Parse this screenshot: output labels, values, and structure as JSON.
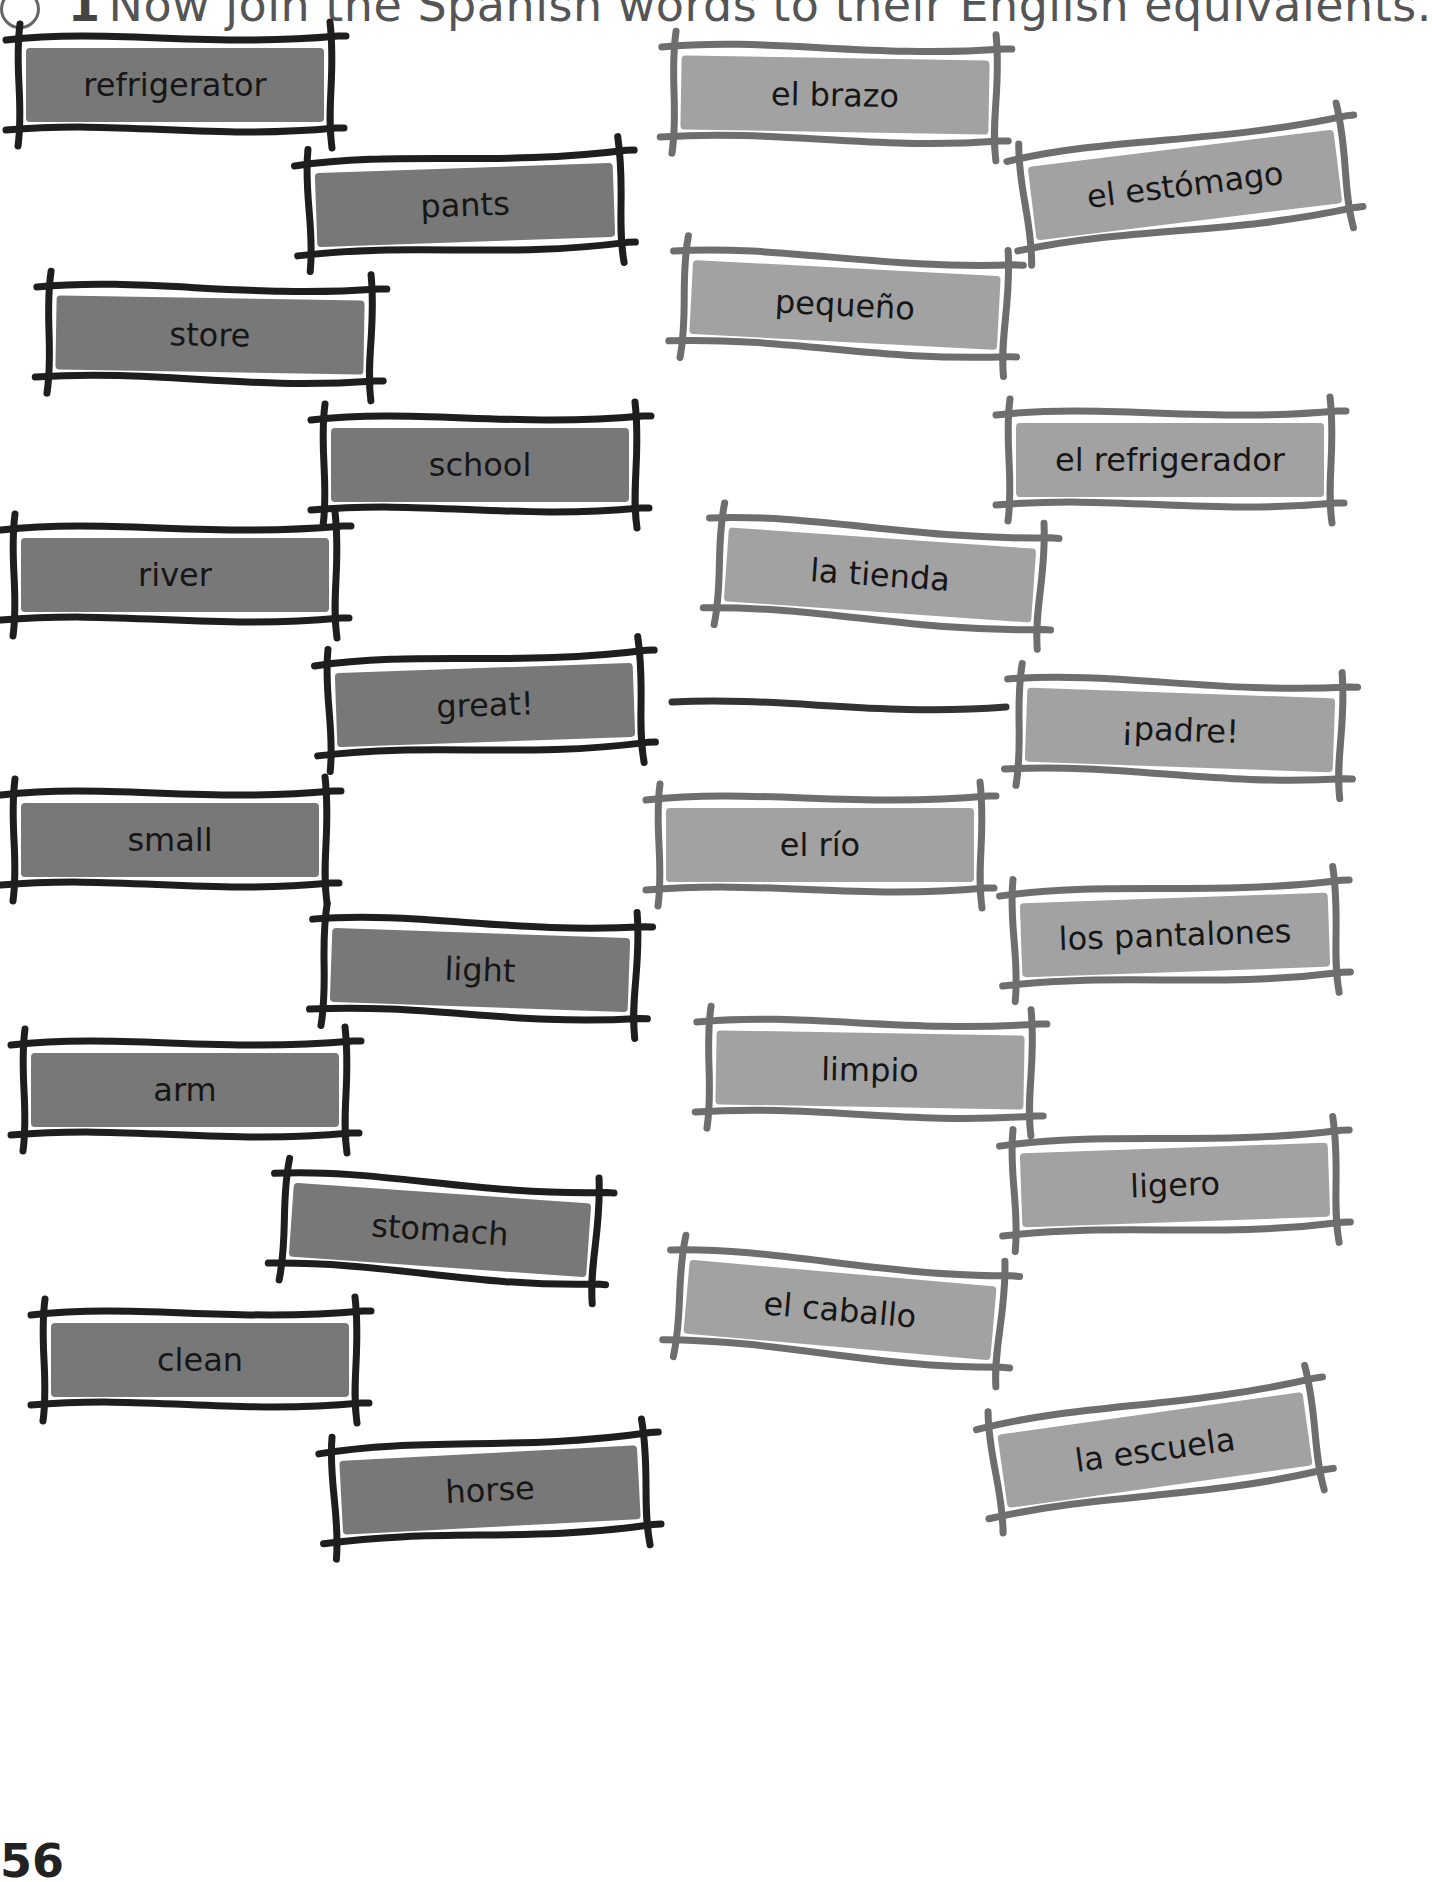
{
  "instruction": {
    "number_badge": "1",
    "text": "Now join the Spanish words to their English equivalents."
  },
  "colors": {
    "english_card_fill": "#787878",
    "english_card_frame": "#1e1e1e",
    "spanish_card_fill": "#a2a2a2",
    "spanish_card_frame": "#6e6e6e",
    "connector": "#333333"
  },
  "english_words": [
    {
      "label": "refrigerator",
      "x": 10,
      "y": 30,
      "w": 330,
      "h": 110,
      "rot": 0
    },
    {
      "label": "pants",
      "x": 300,
      "y": 150,
      "w": 330,
      "h": 110,
      "rot": -2
    },
    {
      "label": "store",
      "x": 40,
      "y": 280,
      "w": 340,
      "h": 110,
      "rot": 1
    },
    {
      "label": "school",
      "x": 315,
      "y": 410,
      "w": 330,
      "h": 110,
      "rot": 0
    },
    {
      "label": "river",
      "x": 5,
      "y": 520,
      "w": 340,
      "h": 110,
      "rot": 0
    },
    {
      "label": "great!",
      "x": 320,
      "y": 650,
      "w": 330,
      "h": 110,
      "rot": -2
    },
    {
      "label": "small",
      "x": 5,
      "y": 785,
      "w": 330,
      "h": 110,
      "rot": 0
    },
    {
      "label": "light",
      "x": 315,
      "y": 915,
      "w": 330,
      "h": 110,
      "rot": 2
    },
    {
      "label": "arm",
      "x": 15,
      "y": 1035,
      "w": 340,
      "h": 110,
      "rot": 0
    },
    {
      "label": "stomach",
      "x": 275,
      "y": 1175,
      "w": 330,
      "h": 110,
      "rot": 4
    },
    {
      "label": "clean",
      "x": 35,
      "y": 1305,
      "w": 330,
      "h": 110,
      "rot": 0
    },
    {
      "label": "horse",
      "x": 325,
      "y": 1435,
      "w": 330,
      "h": 110,
      "rot": -3
    }
  ],
  "spanish_words": [
    {
      "label": "el brazo",
      "x": 665,
      "y": 40,
      "w": 340,
      "h": 110,
      "rot": 1
    },
    {
      "label": "el estómago",
      "x": 1015,
      "y": 130,
      "w": 340,
      "h": 110,
      "rot": -7
    },
    {
      "label": "pequeño",
      "x": 675,
      "y": 250,
      "w": 340,
      "h": 110,
      "rot": 3
    },
    {
      "label": "el refrigerador",
      "x": 1000,
      "y": 405,
      "w": 340,
      "h": 110,
      "rot": 0
    },
    {
      "label": "la tienda",
      "x": 710,
      "y": 520,
      "w": 340,
      "h": 110,
      "rot": 4
    },
    {
      "label": "¡padre!",
      "x": 1010,
      "y": 675,
      "w": 340,
      "h": 110,
      "rot": 2
    },
    {
      "label": "el río",
      "x": 650,
      "y": 790,
      "w": 340,
      "h": 110,
      "rot": 0
    },
    {
      "label": "los pantalones",
      "x": 1005,
      "y": 880,
      "w": 340,
      "h": 110,
      "rot": -2
    },
    {
      "label": "limpio",
      "x": 700,
      "y": 1015,
      "w": 340,
      "h": 110,
      "rot": 1
    },
    {
      "label": "ligero",
      "x": 1005,
      "y": 1130,
      "w": 340,
      "h": 110,
      "rot": -2
    },
    {
      "label": "el caballo",
      "x": 670,
      "y": 1255,
      "w": 340,
      "h": 110,
      "rot": 5
    },
    {
      "label": "la escuela",
      "x": 985,
      "y": 1395,
      "w": 340,
      "h": 110,
      "rot": -8
    }
  ],
  "connections": [
    {
      "from": "great!",
      "to": "¡padre!",
      "x1": 672,
      "y1": 702,
      "x2": 1006,
      "y2": 707
    }
  ],
  "page_number": "56"
}
